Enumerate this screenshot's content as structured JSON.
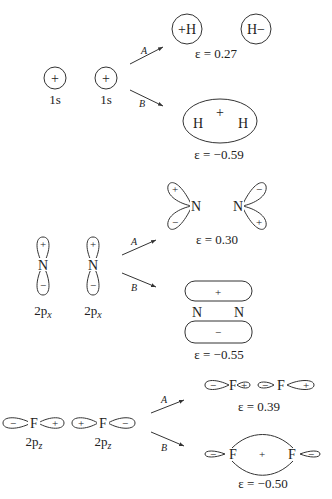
{
  "figure": {
    "rows": [
      {
        "name": "s-orbitals",
        "orbital_label": "1s",
        "atom": "H",
        "reactant_sign": "+",
        "path_a": {
          "label": "A",
          "products": [
            "+H",
            "H−"
          ],
          "energy": "ε = 0.27"
        },
        "path_b": {
          "label": "B",
          "center_sign": "+",
          "atoms": [
            "H",
            "H"
          ],
          "energy": "ε = −0.59"
        }
      },
      {
        "name": "px-orbitals",
        "orbital_label": "2p",
        "orbital_sub": "x",
        "atom": "N",
        "lobe_signs": [
          "+",
          "−"
        ],
        "path_a": {
          "label": "A",
          "atoms": [
            "N",
            "N"
          ],
          "energy": "ε = 0.30"
        },
        "path_b": {
          "label": "B",
          "atoms": [
            "N",
            "N"
          ],
          "top_sign": "+",
          "bottom_sign": "−",
          "energy": "ε = −0.55"
        }
      },
      {
        "name": "pz-orbitals",
        "orbital_label": "2p",
        "orbital_sub": "z",
        "atom": "F",
        "path_a": {
          "label": "A",
          "energy": "ε = 0.39"
        },
        "path_b": {
          "label": "B",
          "center_sign": "+",
          "energy": "ε = −0.50"
        }
      }
    ],
    "signs": {
      "plus": "+",
      "minus": "−"
    }
  }
}
